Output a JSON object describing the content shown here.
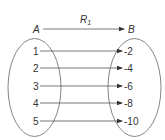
{
  "diagram": {
    "relation": {
      "name": "R",
      "subscript": "1"
    },
    "domain_set": {
      "label": "A",
      "elements": [
        "1",
        "2",
        "3",
        "4",
        "5"
      ]
    },
    "codomain_set": {
      "label": "B",
      "elements": [
        "-2",
        "-4",
        "-6",
        "-8",
        "-10"
      ]
    },
    "mappings": [
      {
        "from": "1",
        "to": "-2"
      },
      {
        "from": "2",
        "to": "-4"
      },
      {
        "from": "3",
        "to": "-6"
      },
      {
        "from": "4",
        "to": "-8"
      },
      {
        "from": "5",
        "to": "-10"
      }
    ],
    "colors": {
      "stroke": "#555555",
      "text": "#333333"
    }
  }
}
